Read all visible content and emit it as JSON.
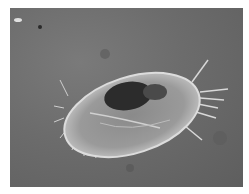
{
  "image": {
    "subject": "ciliated protozoan (micrograph)",
    "style": "grayscale phase-contrast microscopy",
    "background_color": "#6b6b6b",
    "border_color": "#ffffff"
  }
}
